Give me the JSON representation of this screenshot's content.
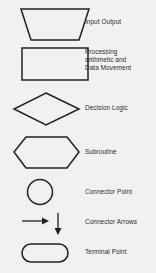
{
  "legend": {
    "title": "Flowchart Symbols Legend",
    "rows": [
      {
        "shape": "trapezoid",
        "label": "Input Output"
      },
      {
        "shape": "rectangle",
        "label": "Processing\narithmetic and\nData Movement"
      },
      {
        "shape": "diamond",
        "label": "Decision Logic"
      },
      {
        "shape": "hexagon",
        "label": "Subroutine"
      },
      {
        "shape": "circle",
        "label": "Connector Point"
      },
      {
        "shape": "arrows",
        "label": "Connector Arrows"
      },
      {
        "shape": "stadium",
        "label": "Terminal Point"
      }
    ]
  },
  "colors": {
    "background": "#f2f1ef",
    "stroke": "#231f20",
    "text": "#2b2b2b"
  }
}
